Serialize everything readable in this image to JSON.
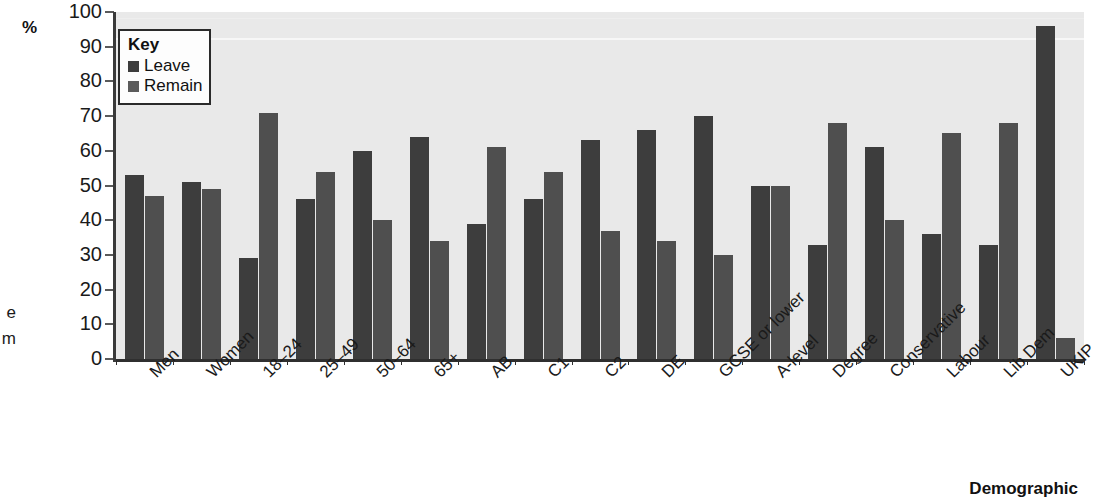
{
  "chart_data": {
    "type": "bar",
    "title": "",
    "subtitle": "",
    "xlabel": "Demographic",
    "ylabel": "%",
    "ylim": [
      0,
      100
    ],
    "ytick_step": 10,
    "yticks": [
      100,
      90,
      80,
      70,
      60,
      50,
      40,
      30,
      20,
      10,
      0
    ],
    "grid": false,
    "legend_position": "top-left",
    "legend_title": "Key",
    "categories": [
      "Men",
      "Women",
      "18–24",
      "25–49",
      "50–64",
      "65+",
      "AB",
      "C1",
      "C2",
      "DE",
      "GCSE or lower",
      "A-level",
      "Degree",
      "Conservative",
      "Labour",
      "Lib Dem",
      "UKIP"
    ],
    "series": [
      {
        "name": "Leave",
        "color": "#3d3d3d",
        "values": [
          53,
          51,
          29,
          46,
          60,
          64,
          39,
          46,
          63,
          66,
          70,
          50,
          33,
          61,
          36,
          33,
          96
        ]
      },
      {
        "name": "Remain",
        "color": "#4f4f4f",
        "values": [
          47,
          49,
          71,
          54,
          40,
          34,
          61,
          54,
          37,
          34,
          30,
          50,
          68,
          40,
          65,
          68,
          6
        ]
      }
    ]
  },
  "legend": {
    "title": "Key",
    "entries": [
      {
        "label": "Leave",
        "swatch": "leave"
      },
      {
        "label": "Remain",
        "swatch": "remain"
      }
    ]
  },
  "axes": {
    "y_unit": "%",
    "x_title": "Demographic"
  },
  "edge_caption": {
    "line1": "e",
    "line2": "m"
  }
}
